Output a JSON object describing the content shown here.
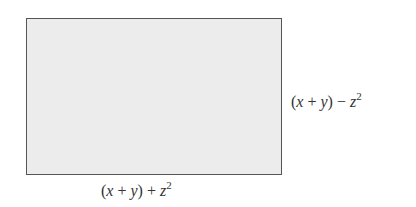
{
  "diagram": {
    "shape": "rectangle",
    "fill_color": "#ececec",
    "border_color": "#555555",
    "labels": {
      "right": {
        "open_paren": "(",
        "var1": "x",
        "op1": " + ",
        "var2": "y",
        "close_paren": ")",
        "op2": " − ",
        "var3": "z",
        "exponent": "2"
      },
      "bottom": {
        "open_paren": "(",
        "var1": "x",
        "op1": " + ",
        "var2": "y",
        "close_paren": ")",
        "op2": " + ",
        "var3": "z",
        "exponent": "2"
      }
    }
  }
}
